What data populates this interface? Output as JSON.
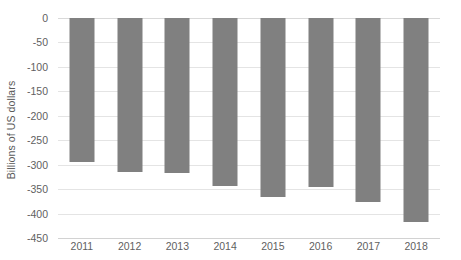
{
  "chart_data": {
    "type": "bar",
    "title": "",
    "subtitle": "",
    "xlabel": "",
    "ylabel": "Billions of US dollars",
    "categories": [
      "2011",
      "2012",
      "2013",
      "2014",
      "2015",
      "2016",
      "2017",
      "2018"
    ],
    "values": [
      -295,
      -315,
      -318,
      -344,
      -367,
      -346,
      -376,
      -417
    ],
    "series": [
      {
        "name": "Balance",
        "values": [
          -295,
          -315,
          -318,
          -344,
          -367,
          -346,
          -376,
          -417
        ]
      }
    ],
    "ylim": [
      -450,
      0
    ],
    "ytick_labels": [
      "0",
      "-50",
      "-100",
      "-150",
      "-200",
      "-250",
      "-300",
      "-350",
      "-400",
      "-450"
    ],
    "ytick_values": [
      0,
      -50,
      -100,
      -150,
      -200,
      -250,
      -300,
      -350,
      -400,
      -450
    ],
    "xtick_labels": [
      "2011",
      "2012",
      "2013",
      "2014",
      "2015",
      "2016",
      "2017",
      "2018"
    ],
    "grid": true,
    "grid_axis": "y",
    "legend": false,
    "legend_position": "none",
    "bar_color": "#808080",
    "gridline_color": "#e4e4e4",
    "axis_text_color": "#5f5f5f",
    "background_color": "#ffffff"
  }
}
